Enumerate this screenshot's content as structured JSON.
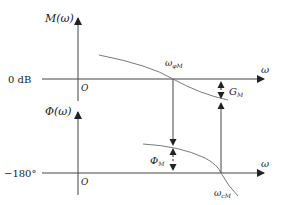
{
  "diagram": {
    "colors": {
      "axis": "#444444",
      "curve": "#7a7a7a",
      "text": "#222222",
      "background": "#ffffff"
    },
    "magnitude_plot": {
      "y_axis_label": "M(ω)",
      "reference_label": "0 dB",
      "origin_label": "O",
      "x_axis_label": "ω",
      "crossover_label_main": "ω",
      "crossover_label_sub": "φM",
      "gain_margin_label_main": "G",
      "gain_margin_label_sub": "M"
    },
    "phase_plot": {
      "y_axis_label": "Φ(ω)",
      "reference_label": "−180°",
      "origin_label": "O",
      "x_axis_label": "ω",
      "crossover_label_main": "ω",
      "crossover_label_sub": "cM",
      "phase_margin_label_main": "Φ",
      "phase_margin_label_sub": "M"
    }
  }
}
